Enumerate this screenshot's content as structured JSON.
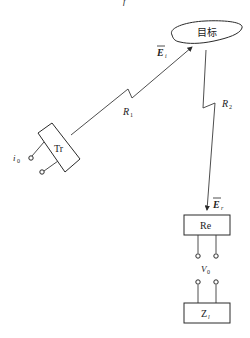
{
  "diagram": {
    "target_label": "目标",
    "transmitter_label": "Tr",
    "receiver_label": "Re",
    "load_label": "Z",
    "load_subscript": "l",
    "incident_field": {
      "symbol": "E",
      "subscript": "i"
    },
    "reflected_field": {
      "symbol": "E",
      "subscript": "r"
    },
    "range_1": {
      "symbol": "R",
      "subscript": "1"
    },
    "range_2": {
      "symbol": "R",
      "subscript": "2"
    },
    "input_current": {
      "symbol": "i",
      "subscript": "0"
    },
    "output_voltage": {
      "symbol": "V",
      "subscript": "0"
    }
  }
}
